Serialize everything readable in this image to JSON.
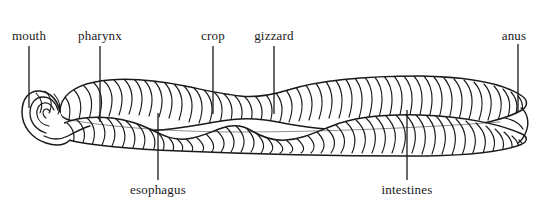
{
  "figure": {
    "background_color": "#ffffff",
    "ink_color": "#1a1a1a",
    "width": 538,
    "height": 222
  },
  "labels": {
    "mouth": "mouth",
    "pharynx": "pharynx",
    "crop": "crop",
    "gizzard": "gizzard",
    "anus": "anus",
    "esophagus": "esophagus",
    "intestines": "intestines"
  },
  "callouts": [
    {
      "key": "mouth",
      "text": "mouth",
      "side": "top",
      "label_x": 29,
      "label_y": 40,
      "line_x": 29,
      "line_y1": 46,
      "line_y2": 108,
      "align": "center"
    },
    {
      "key": "pharynx",
      "text": "pharynx",
      "side": "top",
      "label_x": 100,
      "label_y": 40,
      "line_x": 100,
      "line_y1": 46,
      "line_y2": 122,
      "align": "center"
    },
    {
      "key": "crop",
      "text": "crop",
      "side": "top",
      "label_x": 213,
      "label_y": 40,
      "line_x": 213,
      "line_y1": 46,
      "line_y2": 114,
      "align": "center"
    },
    {
      "key": "gizzard",
      "text": "gizzard",
      "side": "top",
      "label_x": 274,
      "label_y": 40,
      "line_x": 274,
      "line_y1": 46,
      "line_y2": 114,
      "align": "center"
    },
    {
      "key": "anus",
      "text": "anus",
      "side": "top",
      "label_x": 514,
      "label_y": 40,
      "line_x": 518,
      "line_y1": 44,
      "line_y2": 112,
      "align": "center"
    },
    {
      "key": "esophagus",
      "text": "esophagus",
      "side": "bottom",
      "label_x": 158,
      "label_y": 194,
      "line_x": 158,
      "line_y1": 113,
      "line_y2": 180,
      "align": "center"
    },
    {
      "key": "intestines",
      "text": "intestines",
      "side": "bottom",
      "label_x": 407,
      "label_y": 194,
      "line_x": 407,
      "line_y1": 110,
      "line_y2": 180,
      "align": "center"
    }
  ]
}
